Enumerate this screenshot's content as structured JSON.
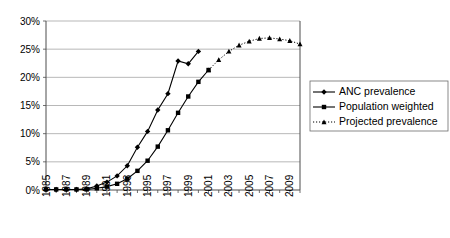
{
  "chart_data": {
    "type": "line",
    "title": "",
    "xlabel": "",
    "ylabel": "",
    "xlim": [
      1985,
      2010
    ],
    "ylim": [
      0,
      30
    ],
    "ytick_values": [
      0,
      5,
      10,
      15,
      20,
      25,
      30
    ],
    "ytick_labels": [
      "0%",
      "5%",
      "10%",
      "15%",
      "20%",
      "25%",
      "30%"
    ],
    "xtick_values": [
      1985,
      1986,
      1987,
      1988,
      1989,
      1990,
      1991,
      1992,
      1993,
      1994,
      1995,
      1996,
      1997,
      1998,
      1999,
      2000,
      2001,
      2002,
      2003,
      2004,
      2005,
      2006,
      2007,
      2008,
      2009,
      2010
    ],
    "xtick_labels": [
      "1985",
      "",
      "1987",
      "",
      "1989",
      "",
      "1991",
      "",
      "1993",
      "",
      "1995",
      "",
      "1997",
      "",
      "1999",
      "",
      "2001",
      "",
      "2003",
      "",
      "2005",
      "",
      "2007",
      "",
      "2009",
      ""
    ],
    "grid": "horizontal",
    "legend_position": "right",
    "series": [
      {
        "name": "ANC prevalence",
        "marker": "diamond",
        "linestyle": "solid",
        "color": "#000000",
        "x": [
          1985,
          1986,
          1987,
          1988,
          1989,
          1990,
          1991,
          1992,
          1993,
          1994,
          1995,
          1996,
          1997,
          1998,
          1999,
          2000
        ],
        "values": [
          0.1,
          0.1,
          0.1,
          0.1,
          0.2,
          0.7,
          1.4,
          2.5,
          4.3,
          7.6,
          10.4,
          14.2,
          17.1,
          22.9,
          22.4,
          24.6
        ]
      },
      {
        "name": "Population weighted",
        "marker": "square",
        "linestyle": "solid",
        "color": "#000000",
        "x": [
          1985,
          1986,
          1987,
          1988,
          1989,
          1990,
          1991,
          1992,
          1993,
          1994,
          1995,
          1996,
          1997,
          1998,
          1999,
          2000,
          2001
        ],
        "values": [
          0.1,
          0.1,
          0.1,
          0.1,
          0.1,
          0.3,
          0.6,
          1.1,
          2.0,
          3.4,
          5.2,
          7.7,
          10.6,
          13.7,
          16.6,
          19.2,
          21.3
        ]
      },
      {
        "name": "Projected prevalence",
        "marker": "triangle",
        "linestyle": "dotted",
        "color": "#000000",
        "x": [
          2001,
          2002,
          2003,
          2004,
          2005,
          2006,
          2007,
          2008,
          2009,
          2010
        ],
        "values": [
          21.3,
          23.1,
          24.6,
          25.7,
          26.4,
          26.9,
          27.0,
          26.8,
          26.5,
          25.9
        ]
      }
    ],
    "legend": [
      {
        "label": "ANC prevalence",
        "marker": "diamond",
        "linestyle": "solid"
      },
      {
        "label": "Population weighted",
        "marker": "square",
        "linestyle": "solid"
      },
      {
        "label": "Projected prevalence",
        "marker": "triangle",
        "linestyle": "dotted"
      }
    ]
  }
}
